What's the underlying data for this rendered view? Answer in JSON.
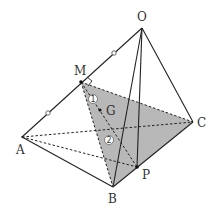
{
  "diagram": {
    "type": "tetrahedron",
    "colors": {
      "line": "#222222",
      "shade": "#b3b3b3",
      "background": "#ffffff"
    },
    "points": {
      "O": {
        "label": "O",
        "x": 142,
        "y": 28
      },
      "A": {
        "label": "A",
        "x": 22,
        "y": 137
      },
      "B": {
        "label": "B",
        "x": 113,
        "y": 187
      },
      "C": {
        "label": "C",
        "x": 193,
        "y": 122
      },
      "M": {
        "label": "M",
        "x": 81,
        "y": 82
      },
      "P": {
        "label": "P",
        "x": 137,
        "y": 167
      },
      "G": {
        "label": "G",
        "x": 100,
        "y": 110
      }
    },
    "markers": {
      "circle1": "①",
      "circle2": "②",
      "num1": "1",
      "num2": "2"
    },
    "shaded_region": "triangle MBC",
    "right_angle_at": "M",
    "equal_segment_marks": [
      "OM",
      "MA"
    ]
  }
}
